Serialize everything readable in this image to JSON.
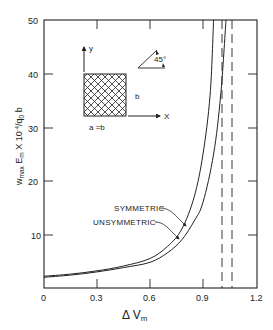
{
  "chart_data": {
    "type": "line",
    "title": "",
    "xlabel": "Δ V_m",
    "ylabel": "w_max E_m X 10^-4 / q_0 b",
    "xlim": [
      0,
      1.2
    ],
    "ylim": [
      0,
      50
    ],
    "x_ticks": [
      "0",
      "0.3",
      "0.6",
      "0.9",
      "1.2"
    ],
    "y_ticks": [
      "10",
      "20",
      "30",
      "40",
      "50"
    ],
    "grid": false,
    "legend_position": "inline annotations",
    "series": [
      {
        "name": "SYMMETRIC",
        "style": "solid",
        "x": [
          0,
          0.15,
          0.3,
          0.45,
          0.6,
          0.7,
          0.78,
          0.85,
          0.9,
          0.94,
          0.96
        ],
        "y": [
          2.2,
          2.6,
          3.2,
          4.1,
          5.5,
          7.8,
          11,
          17,
          25,
          36,
          50
        ]
      },
      {
        "name": "UNSYMMETRIC",
        "style": "solid",
        "x": [
          0,
          0.15,
          0.3,
          0.45,
          0.6,
          0.7,
          0.78,
          0.85,
          0.9,
          0.96,
          1.0,
          1.03
        ],
        "y": [
          2.0,
          2.4,
          3.0,
          3.8,
          4.8,
          6.6,
          9,
          12.5,
          16,
          25,
          36,
          50
        ]
      }
    ],
    "asymptotes": [
      {
        "name": "symmetric-asymptote",
        "style": "dashed",
        "x": 1.01
      },
      {
        "name": "unsymmetric-asymptote",
        "style": "dashed",
        "x": 1.065
      }
    ],
    "annotations": [
      {
        "text": "SYMMETRIC",
        "points_to": "SYMMETRIC"
      },
      {
        "text": "UNSYMMETRIC",
        "points_to": "UNSYMMETRIC"
      }
    ],
    "inset": {
      "axis_x": "X",
      "axis_y": "y",
      "side_label": "b",
      "bottom_label": "a = b",
      "angle_label": "45°",
      "description": "square plate with cross-hatched 45° fibers"
    }
  },
  "labels": {
    "x_axis_title_main": "Δ V",
    "x_axis_title_sub": "m",
    "y_axis_title": "w",
    "y_axis_sub1": "max",
    "y_axis_mid": " E",
    "y_axis_sub2": "m",
    "y_axis_tail": " X 10",
    "y_axis_sup": "-4",
    "y_axis_end": "/q",
    "y_axis_sub3": "0",
    "y_axis_last": " b",
    "tick_x0": "0",
    "tick_x1": "0.3",
    "tick_x2": "0.6",
    "tick_x3": "0.9",
    "tick_x4": "1.2",
    "tick_y10": "10",
    "tick_y20": "20",
    "tick_y30": "30",
    "tick_y40": "40",
    "tick_y50": "50",
    "symmetric": "SYMMETRIC",
    "unsymmetric": "UNSYMMETRIC",
    "inset_y": "y",
    "inset_x": "X",
    "inset_b": "b",
    "inset_ab": "a =b",
    "inset_angle": "45°"
  }
}
